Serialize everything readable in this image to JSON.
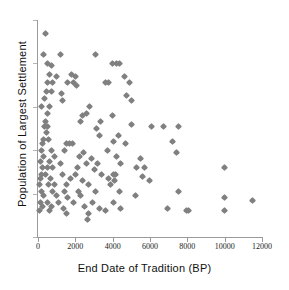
{
  "chart_data": {
    "type": "scatter",
    "title": "",
    "xlabel": "End Date of Tradition (BP)",
    "ylabel": "Population of Largest Settlement",
    "xlim": [
      0,
      12000
    ],
    "ylim": [
      0,
      100
    ],
    "grid": false,
    "legend": null,
    "xticks": [
      0,
      2000,
      4000,
      6000,
      8000,
      10000,
      12000
    ],
    "xtick_labels": [
      "0",
      "2000",
      "4000",
      "6000",
      "8000",
      "10000",
      "12000"
    ],
    "ytick_labels": [],
    "marker": "diamond",
    "marker_color": "#808080",
    "marker_size": 5,
    "series": [
      {
        "name": "Settlement traditions",
        "points": [
          [
            400,
            94
          ],
          [
            300,
            84
          ],
          [
            1200,
            84
          ],
          [
            3100,
            84
          ],
          [
            500,
            80
          ],
          [
            700,
            79
          ],
          [
            4000,
            80
          ],
          [
            4200,
            80
          ],
          [
            4350,
            80
          ],
          [
            600,
            75
          ],
          [
            1000,
            74
          ],
          [
            1800,
            75
          ],
          [
            2000,
            74
          ],
          [
            4650,
            74
          ],
          [
            500,
            71
          ],
          [
            800,
            71
          ],
          [
            1600,
            71
          ],
          [
            1900,
            71
          ],
          [
            2050,
            70
          ],
          [
            3600,
            71
          ],
          [
            3800,
            71
          ],
          [
            4900,
            71
          ],
          [
            450,
            67
          ],
          [
            700,
            67
          ],
          [
            1250,
            66
          ],
          [
            4750,
            65
          ],
          [
            350,
            64
          ],
          [
            1300,
            63
          ],
          [
            5000,
            63
          ],
          [
            200,
            60
          ],
          [
            600,
            60
          ],
          [
            2750,
            60
          ],
          [
            500,
            57
          ],
          [
            2400,
            56
          ],
          [
            2600,
            57
          ],
          [
            4000,
            56
          ],
          [
            400,
            53
          ],
          [
            2300,
            53
          ],
          [
            3350,
            53
          ],
          [
            5000,
            52
          ],
          [
            350,
            51
          ],
          [
            500,
            51
          ],
          [
            3150,
            50
          ],
          [
            6100,
            51
          ],
          [
            6700,
            51
          ],
          [
            7500,
            51
          ],
          [
            450,
            48
          ],
          [
            3300,
            47
          ],
          [
            4300,
            47
          ],
          [
            300,
            45
          ],
          [
            550,
            45
          ],
          [
            4050,
            44
          ],
          [
            7200,
            44
          ],
          [
            250,
            43
          ],
          [
            1500,
            43
          ],
          [
            1700,
            43
          ],
          [
            1850,
            43
          ],
          [
            4700,
            43
          ],
          [
            200,
            40
          ],
          [
            700,
            40
          ],
          [
            1400,
            40
          ],
          [
            2450,
            39
          ],
          [
            3700,
            40
          ],
          [
            7400,
            39
          ],
          [
            300,
            37
          ],
          [
            900,
            37
          ],
          [
            2200,
            37
          ],
          [
            2850,
            36
          ],
          [
            4200,
            37
          ],
          [
            5500,
            36
          ],
          [
            150,
            35
          ],
          [
            600,
            35
          ],
          [
            1200,
            34
          ],
          [
            2600,
            34
          ],
          [
            3200,
            34
          ],
          [
            4400,
            34
          ],
          [
            250,
            32
          ],
          [
            500,
            32
          ],
          [
            800,
            32
          ],
          [
            2100,
            32
          ],
          [
            3000,
            31
          ],
          [
            5300,
            32
          ],
          [
            5700,
            32
          ],
          [
            10000,
            32
          ],
          [
            200,
            29
          ],
          [
            400,
            29
          ],
          [
            1300,
            29
          ],
          [
            2000,
            29
          ],
          [
            3400,
            29
          ],
          [
            4050,
            29
          ],
          [
            4150,
            29
          ],
          [
            5600,
            28
          ],
          [
            150,
            27
          ],
          [
            650,
            27
          ],
          [
            1750,
            27
          ],
          [
            2400,
            26
          ],
          [
            3800,
            27
          ],
          [
            4100,
            26
          ],
          [
            5950,
            26
          ],
          [
            100,
            24
          ],
          [
            550,
            24
          ],
          [
            900,
            24
          ],
          [
            1500,
            24
          ],
          [
            2700,
            24
          ],
          [
            3900,
            24
          ],
          [
            200,
            21
          ],
          [
            750,
            21
          ],
          [
            1400,
            21
          ],
          [
            2150,
            21
          ],
          [
            3100,
            21
          ],
          [
            4350,
            21
          ],
          [
            7500,
            21
          ],
          [
            300,
            19
          ],
          [
            1000,
            19
          ],
          [
            1600,
            18
          ],
          [
            2300,
            19
          ],
          [
            5200,
            19
          ],
          [
            10000,
            18
          ],
          [
            150,
            16
          ],
          [
            500,
            16
          ],
          [
            1100,
            16
          ],
          [
            1900,
            16
          ],
          [
            2900,
            16
          ],
          [
            4050,
            16
          ],
          [
            11500,
            17
          ],
          [
            250,
            14
          ],
          [
            700,
            14
          ],
          [
            1350,
            13
          ],
          [
            2500,
            14
          ],
          [
            3300,
            13
          ],
          [
            4400,
            13
          ],
          [
            6950,
            13
          ],
          [
            100,
            12
          ],
          [
            600,
            12
          ],
          [
            1550,
            11
          ],
          [
            2700,
            11
          ],
          [
            3600,
            12
          ],
          [
            7950,
            12
          ],
          [
            8050,
            12
          ],
          [
            10000,
            12
          ],
          [
            2650,
            8
          ]
        ]
      }
    ]
  }
}
